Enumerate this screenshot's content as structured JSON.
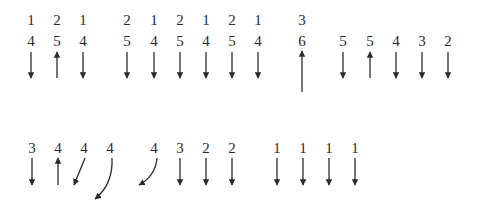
{
  "figure": {
    "row1": {
      "columns": [
        {
          "x": 31,
          "top": "1",
          "bottom": "4",
          "arrow": "down"
        },
        {
          "x": 57,
          "top": "2",
          "bottom": "5",
          "arrow": "up"
        },
        {
          "x": 83,
          "top": "1",
          "bottom": "4",
          "arrow": "down"
        },
        {
          "x": 127,
          "top": "2",
          "bottom": "5",
          "arrow": "down"
        },
        {
          "x": 154,
          "top": "1",
          "bottom": "4",
          "arrow": "down"
        },
        {
          "x": 180,
          "top": "2",
          "bottom": "5",
          "arrow": "down"
        },
        {
          "x": 206,
          "top": "1",
          "bottom": "4",
          "arrow": "down"
        },
        {
          "x": 232,
          "top": "2",
          "bottom": "5",
          "arrow": "down"
        },
        {
          "x": 258,
          "top": "1",
          "bottom": "4",
          "arrow": "down"
        },
        {
          "x": 302,
          "top": "3",
          "bottom": "6",
          "arrow": "up-long"
        },
        {
          "x": 343,
          "top": "",
          "bottom": "5",
          "arrow": "down"
        },
        {
          "x": 370,
          "top": "",
          "bottom": "5",
          "arrow": "up"
        },
        {
          "x": 396,
          "top": "",
          "bottom": "4",
          "arrow": "down"
        },
        {
          "x": 422,
          "top": "",
          "bottom": "3",
          "arrow": "down"
        },
        {
          "x": 448,
          "top": "",
          "bottom": "2",
          "arrow": "down"
        }
      ]
    },
    "row2": {
      "columns": [
        {
          "x": 32,
          "label": "3",
          "arrow": "down"
        },
        {
          "x": 58,
          "label": "4",
          "arrow": "up"
        },
        {
          "x": 84,
          "label": "4",
          "arrow": "diag-down-left"
        },
        {
          "x": 110,
          "label": "4",
          "arrow": "curve-long-down-left"
        },
        {
          "x": 154,
          "label": "4",
          "arrow": "curve-down-left"
        },
        {
          "x": 180,
          "label": "3",
          "arrow": "down"
        },
        {
          "x": 206,
          "label": "2",
          "arrow": "down"
        },
        {
          "x": 232,
          "label": "2",
          "arrow": "down"
        },
        {
          "x": 277,
          "label": "1",
          "arrow": "down"
        },
        {
          "x": 303,
          "label": "1",
          "arrow": "down"
        },
        {
          "x": 329,
          "label": "1",
          "arrow": "down"
        },
        {
          "x": 355,
          "label": "1",
          "arrow": "down"
        }
      ]
    },
    "colors": {
      "ink": "#2a2a2a",
      "background": "#ffffff"
    }
  }
}
